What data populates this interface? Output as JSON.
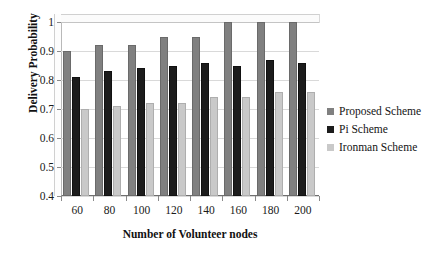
{
  "chart_data": {
    "type": "bar",
    "title": "",
    "xlabel": "Number of Volunteer nodes",
    "ylabel": "Delivery Probability",
    "categories": [
      "60",
      "80",
      "100",
      "120",
      "140",
      "160",
      "180",
      "200"
    ],
    "ylim": [
      0.4,
      1.0
    ],
    "yticks": [
      "0.4",
      "0.5",
      "0.6",
      "0.7",
      "0.8",
      "0.9",
      "1"
    ],
    "ytick_values": [
      0.4,
      0.5,
      0.6,
      0.7,
      0.8,
      0.9,
      1.0
    ],
    "grid": true,
    "legend_position": "right",
    "series": [
      {
        "name": "Proposed Scheme",
        "color": "#808080",
        "values": [
          0.9,
          0.92,
          0.92,
          0.95,
          0.95,
          1.0,
          1.0,
          1.0
        ]
      },
      {
        "name": "Pi Scheme",
        "color": "#1c1c1c",
        "values": [
          0.81,
          0.83,
          0.84,
          0.85,
          0.86,
          0.85,
          0.87,
          0.86
        ]
      },
      {
        "name": "Ironman Scheme",
        "color": "#c9c9c9",
        "values": [
          0.7,
          0.71,
          0.72,
          0.72,
          0.74,
          0.74,
          0.76,
          0.76
        ]
      }
    ]
  }
}
